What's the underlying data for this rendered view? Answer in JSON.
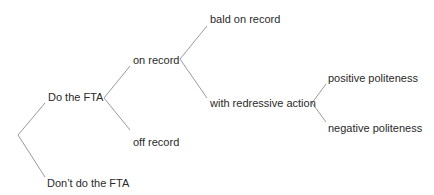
{
  "diagram": {
    "type": "tree",
    "line_color": "#9a9a9a",
    "text_color": "#2a2a2a",
    "nodes": {
      "do_fta": "Do the FTA",
      "dont_fta": "Don’t do the FTA",
      "on_record": "on record",
      "off_record": "off record",
      "bald": "bald on record",
      "redressive": "with redressive action",
      "positive": "positive politeness",
      "negative": "negative politeness"
    },
    "edges": [
      {
        "from": "root",
        "to": "do_fta"
      },
      {
        "from": "root",
        "to": "dont_fta"
      },
      {
        "from": "do_fta",
        "to": "on_record"
      },
      {
        "from": "do_fta",
        "to": "off_record"
      },
      {
        "from": "on_record",
        "to": "bald"
      },
      {
        "from": "on_record",
        "to": "redressive"
      },
      {
        "from": "redressive",
        "to": "positive"
      },
      {
        "from": "redressive",
        "to": "negative"
      }
    ]
  }
}
